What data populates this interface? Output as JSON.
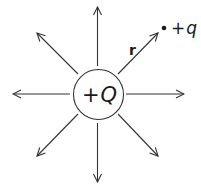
{
  "diagram": {
    "central_charge": {
      "label": "+Q",
      "sign": "+",
      "symbol": "Q"
    },
    "test_charge": {
      "label": "+q",
      "sign": "+",
      "symbol": "q"
    },
    "vector_label": "r",
    "field_lines": 8,
    "colors": {
      "stroke": "#333333",
      "text": "#1a1a1a",
      "background": "#ffffff"
    }
  }
}
